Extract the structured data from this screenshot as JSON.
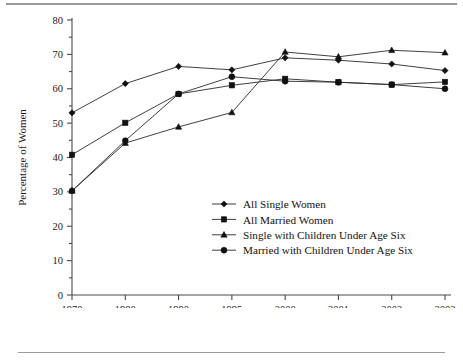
{
  "chart_data": {
    "type": "line",
    "title": "",
    "xlabel": "Year",
    "ylabel": "Percentage of Women",
    "categories": [
      "1970",
      "1980",
      "1990",
      "1995",
      "2000",
      "2001",
      "2002",
      "2003"
    ],
    "ylim": [
      0,
      80
    ],
    "ytick_labels": [
      "0",
      "10",
      "20",
      "30",
      "40",
      "50",
      "60",
      "70",
      "80"
    ],
    "ytick_values": [
      0,
      10,
      20,
      30,
      40,
      50,
      60,
      70,
      80
    ],
    "grid": false,
    "legend_position": "center",
    "series": [
      {
        "name": "All Single Women",
        "marker": "diamond",
        "values": [
          53.0,
          61.5,
          66.5,
          65.5,
          69.0,
          68.3,
          67.2,
          65.3
        ]
      },
      {
        "name": "All Married Women",
        "marker": "square",
        "values": [
          40.8,
          50.1,
          58.5,
          61.0,
          62.9,
          61.9,
          61.2,
          62.0
        ]
      },
      {
        "name": "Single with Children Under Age Six",
        "marker": "triangle",
        "values": [
          30.3,
          44.2,
          48.9,
          53.1,
          70.7,
          69.3,
          71.2,
          70.5
        ]
      },
      {
        "name": "Married with Children Under Age Six",
        "marker": "circle",
        "values": [
          30.3,
          44.9,
          58.5,
          63.5,
          62.2,
          61.9,
          61.2,
          60.0
        ]
      }
    ]
  },
  "figure": {
    "top_rule": "horizontal-rule",
    "bottom_rule": "horizontal-rule"
  }
}
